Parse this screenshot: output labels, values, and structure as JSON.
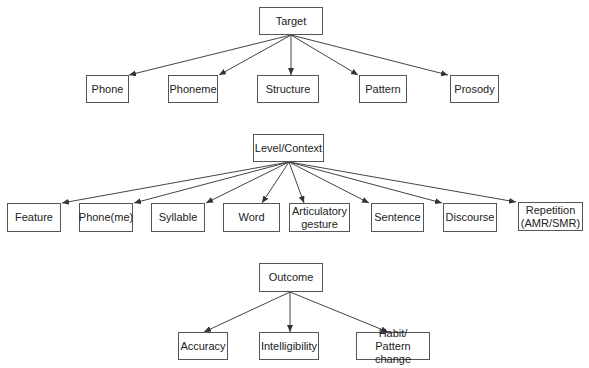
{
  "groups": [
    {
      "root": {
        "id": "target",
        "label": "Target",
        "box": [
          259,
          7,
          64,
          28
        ]
      },
      "children": [
        {
          "id": "phone",
          "label": "Phone",
          "box": [
            86,
            75,
            43,
            28
          ],
          "arrow_end": [
            129,
            75
          ]
        },
        {
          "id": "phoneme",
          "label": "Phoneme",
          "box": [
            168,
            75,
            50,
            28
          ],
          "arrow_end": [
            219,
            75
          ]
        },
        {
          "id": "structure",
          "label": "Structure",
          "box": [
            257,
            75,
            62,
            28
          ],
          "arrow_end": [
            291,
            75
          ]
        },
        {
          "id": "pattern",
          "label": "Pattern",
          "box": [
            359,
            75,
            48,
            28
          ],
          "arrow_end": [
            358,
            75
          ]
        },
        {
          "id": "prosody",
          "label": "Prosody",
          "box": [
            450,
            75,
            49,
            28
          ],
          "arrow_end": [
            448,
            75
          ]
        }
      ],
      "origin": [
        291,
        35
      ]
    },
    {
      "root": {
        "id": "level-context",
        "label": "Level/Context",
        "box": [
          253,
          134,
          71,
          28
        ]
      },
      "children": [
        {
          "id": "feature",
          "label": "Feature",
          "box": [
            7,
            203,
            54,
            29
          ],
          "arrow_end": [
            62,
            203
          ]
        },
        {
          "id": "phoneme-level",
          "label": "Phone(me)",
          "box": [
            79,
            203,
            54,
            29
          ],
          "arrow_end": [
            134,
            203
          ]
        },
        {
          "id": "syllable",
          "label": "Syllable",
          "box": [
            151,
            203,
            54,
            29
          ],
          "arrow_end": [
            206,
            203
          ]
        },
        {
          "id": "word",
          "label": "Word",
          "box": [
            223,
            203,
            57,
            29
          ],
          "arrow_end": [
            262,
            203
          ]
        },
        {
          "id": "articulatory-gesture",
          "label": "Articulatory\ngesture",
          "box": [
            289,
            203,
            61,
            29
          ],
          "arrow_end": [
            304,
            203
          ]
        },
        {
          "id": "sentence",
          "label": "Sentence",
          "box": [
            371,
            203,
            53,
            29
          ],
          "arrow_end": [
            369,
            203
          ]
        },
        {
          "id": "discourse",
          "label": "Discourse",
          "box": [
            443,
            203,
            54,
            29
          ],
          "arrow_end": [
            442,
            203
          ]
        },
        {
          "id": "repetition",
          "label": "Repetition\n(AMR/SMR)",
          "box": [
            518,
            202,
            65,
            29
          ],
          "arrow_end": [
            516,
            202
          ]
        }
      ],
      "origin": [
        289,
        162
      ]
    },
    {
      "root": {
        "id": "outcome",
        "label": "Outcome",
        "box": [
          259,
          263,
          64,
          29
        ]
      },
      "children": [
        {
          "id": "accuracy",
          "label": "Accuracy",
          "box": [
            178,
            332,
            50,
            28
          ],
          "arrow_end": [
            204,
            332
          ]
        },
        {
          "id": "intelligibility",
          "label": "Intelligibility",
          "box": [
            259,
            332,
            60,
            28
          ],
          "arrow_end": [
            290,
            332
          ]
        },
        {
          "id": "habit-pattern-change",
          "label": "Habit/\nPattern change",
          "box": [
            356,
            332,
            74,
            28
          ],
          "arrow_end": [
            388,
            332
          ]
        }
      ],
      "origin": [
        290,
        292
      ]
    }
  ],
  "colors": {
    "line": "#444444",
    "border": "#555555",
    "text": "#222222"
  }
}
